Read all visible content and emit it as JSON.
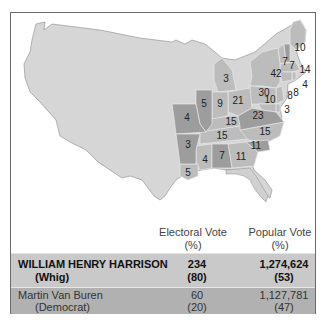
{
  "colors": {
    "background_land": "#d6d6d6",
    "harrison_states": "#bcbcbc",
    "van_buren_states": "#9d9d9d",
    "winner_row": "#c9c9c9",
    "loser_row": "#b1b1b1",
    "frame_border": "#6a6a6a"
  },
  "map": {
    "state_labels": [
      {
        "state": "Maine",
        "votes": "10"
      },
      {
        "state": "Vermont",
        "votes": "7"
      },
      {
        "state": "New Hampshire",
        "votes": "7"
      },
      {
        "state": "Massachusetts",
        "votes": "14"
      },
      {
        "state": "New York",
        "votes": "42"
      },
      {
        "state": "Rhode Island",
        "votes": "4"
      },
      {
        "state": "Connecticut",
        "votes": "8"
      },
      {
        "state": "New Jersey",
        "votes": "8"
      },
      {
        "state": "Pennsylvania",
        "votes": "30"
      },
      {
        "state": "Maryland",
        "votes": "10"
      },
      {
        "state": "Delaware",
        "votes": "3"
      },
      {
        "state": "Michigan",
        "votes": "3"
      },
      {
        "state": "Ohio",
        "votes": "21"
      },
      {
        "state": "Indiana",
        "votes": "9"
      },
      {
        "state": "Illinois",
        "votes": "5"
      },
      {
        "state": "Missouri",
        "votes": "4"
      },
      {
        "state": "Kentucky",
        "votes": "15"
      },
      {
        "state": "Virginia",
        "votes": "23"
      },
      {
        "state": "Tennessee",
        "votes": "15"
      },
      {
        "state": "North Carolina",
        "votes": "15"
      },
      {
        "state": "South Carolina",
        "votes": "11"
      },
      {
        "state": "Georgia",
        "votes": "11"
      },
      {
        "state": "Alabama",
        "votes": "7"
      },
      {
        "state": "Mississippi",
        "votes": "4"
      },
      {
        "state": "Arkansas",
        "votes": "3"
      },
      {
        "state": "Louisiana",
        "votes": "5"
      }
    ]
  },
  "table": {
    "headers": {
      "electoral": {
        "line1": "Electoral Vote",
        "line2": "(%)"
      },
      "popular": {
        "line1": "Popular Vote",
        "line2": "(%)"
      }
    },
    "rows": [
      {
        "name": "WILLIAM HENRY HARRISON",
        "party": "(Whig)",
        "electoral": "234",
        "electoral_pct": "(80)",
        "popular": "1,274,624",
        "popular_pct": "(53)"
      },
      {
        "name": "Martin Van Buren",
        "party": "(Democrat)",
        "electoral": "60",
        "electoral_pct": "(20)",
        "popular": "1,127,781",
        "popular_pct": "(47)"
      }
    ]
  }
}
